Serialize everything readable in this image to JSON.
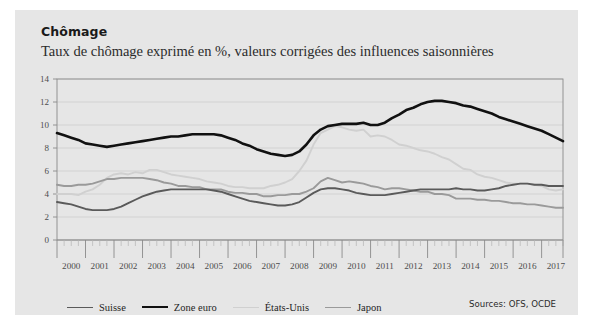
{
  "card": {
    "background_color": "#e6e6e6",
    "page_background_color": "#ffffff"
  },
  "header": {
    "title": "Chômage",
    "subtitle": "Taux de chômage exprimé en %, valeurs corrigées des influences saisonnières"
  },
  "footer": {
    "sources": "Sources: OFS, OCDE"
  },
  "legend": {
    "items": [
      {
        "label": "Suisse",
        "color": "#5a5a5a"
      },
      {
        "label": "Zone euro",
        "color": "#111111"
      },
      {
        "label": "États-Unis",
        "color": "#d0d0d0"
      },
      {
        "label": "Japon",
        "color": "#9a9a9a"
      }
    ]
  },
  "chart_data": {
    "type": "line",
    "title": "Chômage",
    "subtitle": "Taux de chômage exprimé en %, valeurs corrigées des influences saisonnières",
    "xlabel": "",
    "ylabel": "",
    "unit": "%",
    "grid": true,
    "legend_position": "bottom-left",
    "xlim": [
      2000,
      2017.75
    ],
    "ylim": [
      0,
      14
    ],
    "yticks": [
      0,
      2,
      4,
      6,
      8,
      10,
      12,
      14
    ],
    "xticks": [
      2000,
      2001,
      2002,
      2003,
      2004,
      2005,
      2006,
      2007,
      2008,
      2009,
      2010,
      2011,
      2012,
      2013,
      2014,
      2015,
      2016,
      2017
    ],
    "x_minor_ticks_per_year": 4,
    "x": [
      2000.0,
      2000.25,
      2000.5,
      2000.75,
      2001.0,
      2001.25,
      2001.5,
      2001.75,
      2002.0,
      2002.25,
      2002.5,
      2002.75,
      2003.0,
      2003.25,
      2003.5,
      2003.75,
      2004.0,
      2004.25,
      2004.5,
      2004.75,
      2005.0,
      2005.25,
      2005.5,
      2005.75,
      2006.0,
      2006.25,
      2006.5,
      2006.75,
      2007.0,
      2007.25,
      2007.5,
      2007.75,
      2008.0,
      2008.25,
      2008.5,
      2008.75,
      2009.0,
      2009.25,
      2009.5,
      2009.75,
      2010.0,
      2010.25,
      2010.5,
      2010.75,
      2011.0,
      2011.25,
      2011.5,
      2011.75,
      2012.0,
      2012.25,
      2012.5,
      2012.75,
      2013.0,
      2013.25,
      2013.5,
      2013.75,
      2014.0,
      2014.25,
      2014.5,
      2014.75,
      2015.0,
      2015.25,
      2015.5,
      2015.75,
      2016.0,
      2016.25,
      2016.5,
      2016.75,
      2017.0,
      2017.25,
      2017.5,
      2017.75
    ],
    "series": [
      {
        "name": "Suisse",
        "color": "#5a5a5a",
        "width": 1.9,
        "values": [
          3.3,
          3.2,
          3.1,
          2.9,
          2.7,
          2.6,
          2.6,
          2.6,
          2.7,
          2.9,
          3.2,
          3.5,
          3.8,
          4.0,
          4.2,
          4.3,
          4.4,
          4.4,
          4.4,
          4.4,
          4.4,
          4.4,
          4.3,
          4.2,
          4.0,
          3.8,
          3.6,
          3.4,
          3.3,
          3.2,
          3.1,
          3.0,
          3.0,
          3.1,
          3.3,
          3.7,
          4.1,
          4.4,
          4.5,
          4.5,
          4.4,
          4.3,
          4.1,
          4.0,
          3.9,
          3.9,
          3.9,
          4.0,
          4.1,
          4.2,
          4.3,
          4.4,
          4.4,
          4.4,
          4.4,
          4.4,
          4.5,
          4.4,
          4.4,
          4.3,
          4.3,
          4.4,
          4.5,
          4.7,
          4.8,
          4.9,
          4.9,
          4.8,
          4.8,
          4.7,
          4.7,
          4.7
        ]
      },
      {
        "name": "Zone euro",
        "color": "#111111",
        "width": 2.6,
        "values": [
          9.3,
          9.1,
          8.9,
          8.7,
          8.4,
          8.3,
          8.2,
          8.1,
          8.2,
          8.3,
          8.4,
          8.5,
          8.6,
          8.7,
          8.8,
          8.9,
          9.0,
          9.0,
          9.1,
          9.2,
          9.2,
          9.2,
          9.2,
          9.1,
          8.9,
          8.7,
          8.4,
          8.2,
          7.9,
          7.7,
          7.5,
          7.4,
          7.3,
          7.4,
          7.7,
          8.3,
          9.1,
          9.6,
          9.9,
          10.0,
          10.1,
          10.1,
          10.1,
          10.2,
          10.0,
          10.0,
          10.2,
          10.6,
          10.9,
          11.3,
          11.5,
          11.8,
          12.0,
          12.1,
          12.1,
          12.0,
          11.9,
          11.7,
          11.6,
          11.4,
          11.2,
          11.0,
          10.7,
          10.5,
          10.3,
          10.1,
          9.9,
          9.7,
          9.5,
          9.2,
          8.9,
          8.6
        ]
      },
      {
        "name": "États-Unis",
        "color": "#d0d0d0",
        "width": 1.9,
        "values": [
          4.0,
          4.0,
          4.0,
          3.9,
          4.2,
          4.4,
          4.8,
          5.4,
          5.7,
          5.8,
          5.7,
          5.9,
          5.8,
          6.1,
          6.1,
          5.9,
          5.7,
          5.6,
          5.5,
          5.4,
          5.3,
          5.1,
          5.0,
          4.9,
          4.7,
          4.6,
          4.6,
          4.5,
          4.5,
          4.5,
          4.7,
          4.8,
          5.0,
          5.3,
          6.0,
          6.9,
          8.3,
          9.3,
          9.6,
          9.9,
          9.8,
          9.6,
          9.5,
          9.6,
          9.0,
          9.1,
          9.0,
          8.7,
          8.3,
          8.2,
          8.0,
          7.8,
          7.7,
          7.5,
          7.2,
          7.0,
          6.6,
          6.2,
          6.1,
          5.7,
          5.5,
          5.4,
          5.2,
          5.0,
          4.9,
          4.9,
          4.9,
          4.8,
          4.7,
          4.4,
          4.3,
          4.4
        ]
      },
      {
        "name": "Japon",
        "color": "#9a9a9a",
        "width": 1.9,
        "values": [
          4.8,
          4.7,
          4.7,
          4.8,
          4.8,
          4.9,
          5.1,
          5.3,
          5.3,
          5.4,
          5.4,
          5.4,
          5.4,
          5.3,
          5.2,
          5.0,
          4.9,
          4.7,
          4.7,
          4.6,
          4.6,
          4.4,
          4.4,
          4.4,
          4.2,
          4.1,
          4.1,
          4.0,
          4.0,
          3.8,
          3.8,
          3.9,
          3.9,
          4.0,
          4.0,
          4.2,
          4.5,
          5.1,
          5.4,
          5.2,
          5.0,
          5.1,
          5.0,
          4.9,
          4.7,
          4.6,
          4.4,
          4.5,
          4.5,
          4.4,
          4.3,
          4.2,
          4.2,
          4.0,
          4.0,
          3.9,
          3.6,
          3.6,
          3.6,
          3.5,
          3.5,
          3.4,
          3.4,
          3.3,
          3.2,
          3.2,
          3.1,
          3.1,
          3.0,
          2.9,
          2.8,
          2.8
        ]
      }
    ]
  }
}
